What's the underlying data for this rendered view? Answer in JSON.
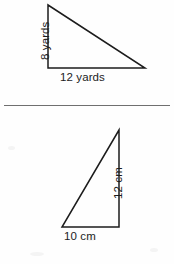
{
  "page": {
    "background_color": "#fefefe",
    "stroke_color": "#1c1c1c",
    "divider_color": "#6f6f6f",
    "width": 174,
    "height": 264
  },
  "divider": {
    "name": "horizontal-rule",
    "x_start": 4,
    "x_end": 170,
    "y": 105
  },
  "figures": [
    {
      "id": "figure-top",
      "shape": "right-triangle",
      "right_angle_at": "bottom-left",
      "unit": "yards",
      "vertices": {
        "apex": {
          "x": 48,
          "y": 5
        },
        "bottom_left": {
          "x": 48,
          "y": 68
        },
        "bottom_right": {
          "x": 145,
          "y": 68
        }
      },
      "labels": {
        "height": "8 yards",
        "base": "12 yards"
      },
      "measurements": {
        "height_value": 8,
        "base_value": 12,
        "units": "yards"
      }
    },
    {
      "id": "figure-bottom",
      "shape": "right-triangle",
      "right_angle_at": "bottom-right",
      "unit": "cm",
      "vertices": {
        "apex": {
          "x": 119,
          "y": 130
        },
        "bottom_left": {
          "x": 62,
          "y": 227
        },
        "bottom_right": {
          "x": 119,
          "y": 227
        }
      },
      "labels": {
        "height": "12 cm",
        "base": "10 cm"
      },
      "measurements": {
        "height_value": 12,
        "base_value": 10,
        "units": "cm"
      }
    }
  ]
}
